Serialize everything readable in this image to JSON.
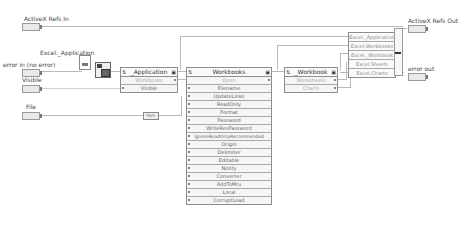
{
  "controls": {
    "activex_refs_in": {
      "label": "ActiveX Refs In",
      "terminal": "•[]•"
    },
    "excel_application": {
      "label": "Excel._Application"
    },
    "error_in": {
      "label": "error in (no error)"
    },
    "visible": {
      "label": "Visible"
    },
    "file": {
      "label": "File"
    }
  },
  "indicators": {
    "activex_refs_out": {
      "label": "ActiveX Refs Out"
    },
    "error_out": {
      "label": "error out"
    }
  },
  "nodes": {
    "application": {
      "title": "_Application",
      "rows": [
        {
          "label": "Workbooks",
          "dim": true
        },
        {
          "label": "Visible",
          "dim": false
        }
      ]
    },
    "workbooks": {
      "title": "Workbooks",
      "rows": [
        {
          "label": "Open",
          "dim": true
        },
        {
          "label": "Filename"
        },
        {
          "label": "UpdateLinks"
        },
        {
          "label": "ReadOnly"
        },
        {
          "label": "Format"
        },
        {
          "label": "Password"
        },
        {
          "label": "WriteResPassword"
        },
        {
          "label": "IgnoreReadOnlyRecommended"
        },
        {
          "label": "Origin"
        },
        {
          "label": "Delimiter"
        },
        {
          "label": "Editable"
        },
        {
          "label": "Notify"
        },
        {
          "label": "Converter"
        },
        {
          "label": "AddToMru"
        },
        {
          "label": "Local"
        },
        {
          "label": "CorruptLoad"
        }
      ]
    },
    "workbook": {
      "title": "_Workbook",
      "rows": [
        {
          "label": "Worksheets",
          "dim": true
        },
        {
          "label": "Charts",
          "dim": true
        }
      ]
    }
  },
  "bundle": {
    "items": [
      "Excel._Application",
      "Excel.Workbooks",
      "Excel._Workbook",
      "Excel.Sheets",
      "Excel.Charts"
    ]
  },
  "path_constant": "Path",
  "icons": {
    "open_automation": "automation-open-icon",
    "class_constant": "class-constant-icon"
  }
}
